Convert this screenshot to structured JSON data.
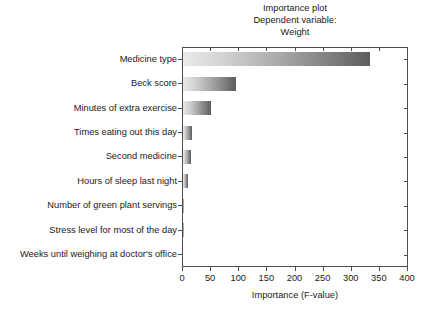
{
  "chart_data": {
    "type": "bar",
    "orientation": "horizontal",
    "title": "Importance plot",
    "subtitle": "Dependent variable:",
    "subtitle2": "Weight",
    "title_lines": [
      "Importance plot",
      "Dependent variable:",
      "Weight"
    ],
    "xlabel": "Importance (F-value)",
    "ylabel": "",
    "xlim": [
      0,
      400
    ],
    "ylim": null,
    "grid": false,
    "legend": null,
    "xticks": [
      0,
      50,
      100,
      150,
      200,
      250,
      300,
      350,
      400
    ],
    "xtick_labels": [
      "0",
      "50",
      "100",
      "150",
      "200",
      "250",
      "300",
      "350",
      "400"
    ],
    "categories": [
      "Medicine type",
      "Beck score",
      "Minutes of extra exercise",
      "Times eating out this day",
      "Second medicine",
      "Hours of sleep last night",
      "Number of green plant servings",
      "Stress level for most of the day",
      "Weeks until weighing at doctor's office"
    ],
    "values": [
      333,
      95,
      50,
      16,
      15,
      8,
      1,
      1,
      0
    ],
    "bar_fill": "grayscale-gradient",
    "bar_gradient_from": "#eaeaea",
    "bar_gradient_to": "#5c5c5c",
    "axis_color": "#4d4d4d",
    "text_color": "#1a1a1a",
    "background": "#ffffff"
  }
}
